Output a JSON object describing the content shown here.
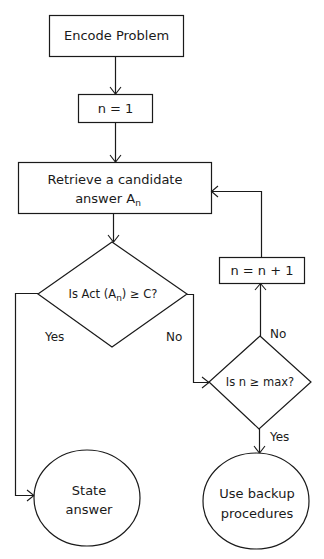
{
  "diagram": {
    "type": "flowchart",
    "nodes": {
      "encode": {
        "label": "Encode Problem",
        "shape": "rectangle"
      },
      "init": {
        "label": "n = 1",
        "shape": "rectangle"
      },
      "retrieve": {
        "line1": "Retrieve a candidate",
        "line2": "answer A",
        "subscript": "n",
        "shape": "rectangle"
      },
      "decision1": {
        "prefix": "Is Act (A",
        "subscript": "n",
        "suffix": ") ≥ C?",
        "shape": "diamond"
      },
      "increment": {
        "label": "n = n + 1",
        "shape": "rectangle"
      },
      "decision2": {
        "label": "Is n ≥ max?",
        "shape": "diamond"
      },
      "state_answer": {
        "line1": "State",
        "line2": "answer",
        "shape": "ellipse"
      },
      "backup": {
        "line1": "Use backup",
        "line2": "procedures",
        "shape": "ellipse"
      }
    },
    "edge_labels": {
      "d1_yes": "Yes",
      "d1_no": "No",
      "d2_no": "No",
      "d2_yes": "Yes"
    },
    "edges": [
      {
        "from": "encode",
        "to": "init"
      },
      {
        "from": "init",
        "to": "retrieve"
      },
      {
        "from": "retrieve",
        "to": "decision1"
      },
      {
        "from": "decision1",
        "to": "state_answer",
        "label": "Yes"
      },
      {
        "from": "decision1",
        "to": "decision2",
        "label": "No"
      },
      {
        "from": "decision2",
        "to": "increment",
        "label": "No"
      },
      {
        "from": "increment",
        "to": "retrieve"
      },
      {
        "from": "decision2",
        "to": "backup",
        "label": "Yes"
      }
    ],
    "colors": {
      "stroke": "#1a1a1a",
      "background": "#ffffff"
    }
  }
}
